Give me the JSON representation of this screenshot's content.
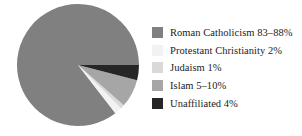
{
  "chart_data": {
    "type": "pie",
    "title": "",
    "legend_position": "right",
    "background_color": "#ffffff",
    "center": {
      "x": 78,
      "y": 65
    },
    "radius": 61,
    "start_angle_deg": 0,
    "direction": "counterclockwise",
    "categories": [
      "Roman Catholicism",
      "Protestant Christianity",
      "Judaism",
      "Islam",
      "Unaffiliated"
    ],
    "value_labels": [
      "83–88%",
      "2%",
      "1%",
      "5–10%",
      "4%"
    ],
    "values": [
      85.5,
      2,
      1,
      7.5,
      4
    ],
    "colors": [
      "#808080",
      "#f2f2f2",
      "#d9d9d9",
      "#a6a6a6",
      "#262626"
    ],
    "slices": [
      {
        "label": "Roman Catholicism",
        "value_label": "83–88%",
        "value": 85.5,
        "color": "#808080"
      },
      {
        "label": "Protestant Christianity",
        "value_label": "2%",
        "value": 2,
        "color": "#f2f2f2"
      },
      {
        "label": "Judaism",
        "value_label": "1%",
        "value": 1,
        "color": "#d9d9d9"
      },
      {
        "label": "Islam",
        "value_label": "5–10%",
        "value": 7.5,
        "color": "#a6a6a6"
      },
      {
        "label": "Unaffiliated",
        "value_label": "4%",
        "value": 4,
        "color": "#262626"
      }
    ]
  },
  "legend": {
    "items": [
      {
        "label": "Roman Catholicism 83–88%",
        "color": "#808080"
      },
      {
        "label": "Protestant Christianity 2%",
        "color": "#f2f2f2"
      },
      {
        "label": "Judaism 1%",
        "color": "#d9d9d9"
      },
      {
        "label": "Islam 5–10%",
        "color": "#a6a6a6"
      },
      {
        "label": "Unaffiliated 4%",
        "color": "#262626"
      }
    ]
  }
}
